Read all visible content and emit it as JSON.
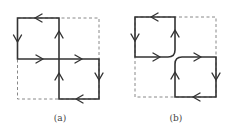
{
  "figure": {
    "panels": [
      {
        "id": "a",
        "label": "(a)",
        "description": "Two square loops sharing a crossing point at the center; edges cross without rounding",
        "outer_box": "dashed square",
        "loops": [
          {
            "name": "top-left loop",
            "direction": "counterclockwise"
          },
          {
            "name": "bottom-right loop",
            "direction": "clockwise"
          }
        ]
      },
      {
        "id": "b",
        "label": "(b)",
        "description": "Same configuration after resolving the crossing: two separate loops with rounded corners near the center",
        "outer_box": "dashed square",
        "loops": [
          {
            "name": "top-left loop",
            "direction": "counterclockwise"
          },
          {
            "name": "bottom-right loop",
            "direction": "clockwise"
          }
        ]
      }
    ],
    "colors": {
      "line": "#333333",
      "dashed": "#888888",
      "background": "#ffffff"
    }
  }
}
